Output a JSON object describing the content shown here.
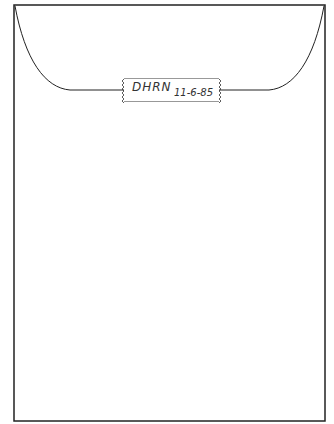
{
  "envelope": {
    "label": {
      "code": "DHRN",
      "date": "11-6-85"
    }
  }
}
